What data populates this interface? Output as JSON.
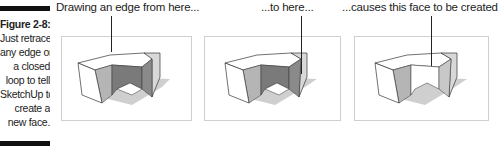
{
  "figure": {
    "number": "Figure 2-8:",
    "caption_lines": [
      "Just retrace",
      "any edge on",
      "a closed",
      "loop to tell",
      "SketchUp to",
      "create a",
      "new face."
    ]
  },
  "panels": [
    {
      "label": "Drawing an edge from here...",
      "state": "edge-start"
    },
    {
      "label": "...to here...",
      "state": "edge-end"
    },
    {
      "label": "...causes this face to be created",
      "state": "face-created"
    }
  ],
  "colors": {
    "frame_border": "#cfcfcf",
    "face_dark": "#7a7a7a",
    "face_mid": "#b5b5b5",
    "face_light": "#ffffff",
    "shadow": "#c8c8c8",
    "edge": "#333333"
  }
}
